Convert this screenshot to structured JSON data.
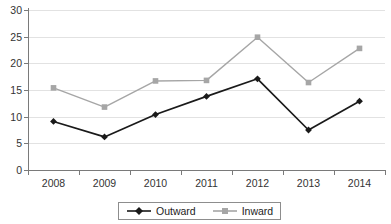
{
  "chart_data": {
    "type": "line",
    "title": "",
    "subtitle": "",
    "xlabel": "",
    "ylabel": "",
    "categories": [
      "2008",
      "2009",
      "2010",
      "2011",
      "2012",
      "2013",
      "2014"
    ],
    "series": [
      {
        "name": "Outward",
        "color": "#1a1a1a",
        "marker": "diamond",
        "values": [
          9.1,
          6.2,
          10.4,
          13.8,
          17.1,
          7.5,
          12.9
        ]
      },
      {
        "name": "Inward",
        "color": "#a6a6a6",
        "marker": "square",
        "values": [
          15.4,
          11.8,
          16.7,
          16.8,
          24.9,
          16.4,
          22.8
        ]
      }
    ],
    "ylim": [
      0,
      30
    ],
    "ytick_step": 5,
    "yticks": [
      "0",
      "5",
      "10",
      "15",
      "20",
      "25",
      "30"
    ],
    "xticks": [
      "2008",
      "2009",
      "2010",
      "2011",
      "2012",
      "2013",
      "2014"
    ],
    "grid": true,
    "grid_axis": "y",
    "grid_color": "#e2e2e2",
    "legend": {
      "position": "bottom",
      "bordered": true,
      "entries": [
        {
          "label": "Outward",
          "color": "#1a1a1a",
          "marker": "diamond"
        },
        {
          "label": "Inward",
          "color": "#a6a6a6",
          "marker": "square"
        }
      ]
    }
  }
}
